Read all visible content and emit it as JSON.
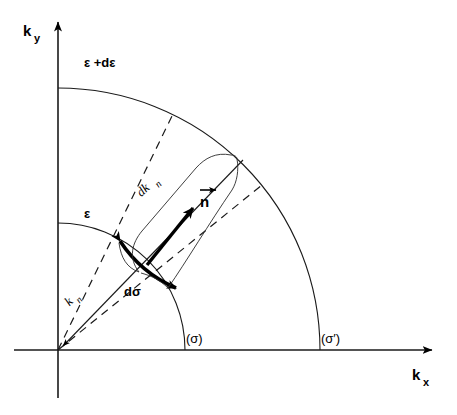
{
  "figure": {
    "kind": "physics-diagram",
    "background_color": "#ffffff",
    "ink_color": "#000000"
  },
  "axes": {
    "y_axis": {
      "symbol": "k",
      "subscript": "y",
      "arrow": "up"
    },
    "x_axis": {
      "symbol": "k",
      "subscript": "x",
      "arrow": "right"
    },
    "origin": {
      "x": 58,
      "y": 350
    }
  },
  "arcs": {
    "inner": {
      "label": "ε",
      "label_x": 84,
      "label_y": 218,
      "radius": 127
    },
    "outer": {
      "label": "ε +dε",
      "label_x": 84,
      "label_y": 67,
      "radius": 262
    },
    "cross_section_inner": {
      "label": "(σ)",
      "label_x": 186,
      "label_y": 343
    },
    "cross_section_outer": {
      "label": "(σ′)",
      "label_x": 321,
      "label_y": 343
    }
  },
  "labels": {
    "wavevector": {
      "symbol": "k",
      "subscript": "n",
      "x": 72,
      "y": 295
    },
    "thickness": {
      "symbol": "dk",
      "subscript": "n",
      "x": 150,
      "y": 185
    },
    "area_element": {
      "text": "dσ",
      "x": 131,
      "y": 292
    },
    "normal_vector": {
      "text": "n",
      "x": 205,
      "y": 207
    }
  },
  "elements": {
    "radial_solid_ray": "k_n arrow from origin outward",
    "dashed_rays": [
      "left boundary of d-sigma wedge",
      "right boundary of d-sigma wedge"
    ],
    "thick_arc": "d-sigma surface element with arrowheads at both ends",
    "thick_vector": "surface normal direction vector",
    "brace_curve": "curly brace indicating dk_n shell thickness"
  }
}
